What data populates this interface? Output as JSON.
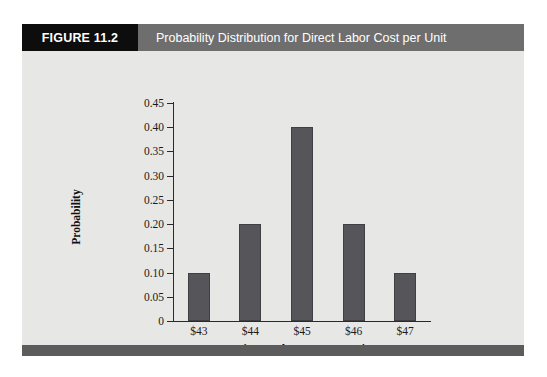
{
  "figure": {
    "number_label": "FIGURE 11.2",
    "title": "Probability Distribution for Direct Labor Cost per Unit"
  },
  "colors": {
    "header_number_bg": "#0d0d0d",
    "header_title_bg": "#6e6e6e",
    "header_text": "#ffffff",
    "body_bg": "#e7e7e5",
    "footer_bar": "#5c5c5c",
    "bar_fill": "#55555a",
    "axis": "#2a2a2a"
  },
  "chart_data": {
    "type": "bar",
    "title": "Probability Distribution for Direct Labor Cost per Unit",
    "xlabel": "Direct Labor Cost Per Unit",
    "ylabel": "Probability",
    "categories": [
      "$43",
      "$44",
      "$45",
      "$46",
      "$47"
    ],
    "values": [
      0.1,
      0.2,
      0.4,
      0.2,
      0.1
    ],
    "ylim": [
      0,
      0.45
    ],
    "ytick_labels": [
      "0",
      "0.05",
      "0.10",
      "0.15",
      "0.20",
      "0.25",
      "0.30",
      "0.35",
      "0.40",
      "0.45"
    ],
    "ytick_values": [
      0,
      0.05,
      0.1,
      0.15,
      0.2,
      0.25,
      0.3,
      0.35,
      0.4,
      0.45
    ],
    "grid": false,
    "legend": null
  }
}
